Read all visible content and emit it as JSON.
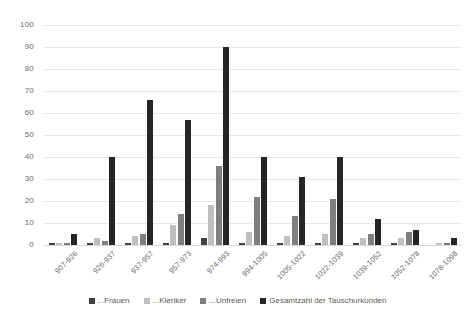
{
  "chart_data": {
    "type": "bar",
    "title": "",
    "subtitle": "",
    "xlabel": "",
    "ylabel": "",
    "ylim": [
      0,
      100
    ],
    "ytick_step": 10,
    "grid": true,
    "legend_position": "bottom",
    "categories": [
      "907-926",
      "926-937",
      "937-957",
      "957-973",
      "974-993",
      "994-1005",
      "1005-1022",
      "1022-1039",
      "1039-1052",
      "1052-1078",
      "1078-1098"
    ],
    "series": [
      {
        "name": "...Frauen",
        "color": "#404040",
        "values": [
          1,
          1,
          1,
          1,
          3,
          1,
          1,
          1,
          1,
          1,
          0
        ]
      },
      {
        "name": "...Kleriker",
        "color": "#bfbfbf",
        "values": [
          1,
          3,
          4,
          9,
          18,
          6,
          4,
          5,
          3,
          3,
          1
        ]
      },
      {
        "name": "...Unfreien",
        "color": "#7f7f7f",
        "values": [
          1,
          2,
          5,
          14,
          36,
          22,
          13,
          21,
          5,
          6,
          1
        ]
      },
      {
        "name": "Gesamtzahl der Tauschurkunden",
        "color": "#262626",
        "values": [
          5,
          40,
          66,
          57,
          90,
          40,
          31,
          40,
          12,
          7,
          3
        ]
      }
    ],
    "ytick_labels": [
      "0",
      "10",
      "20",
      "30",
      "40",
      "50",
      "60",
      "70",
      "80",
      "90",
      "100"
    ]
  }
}
